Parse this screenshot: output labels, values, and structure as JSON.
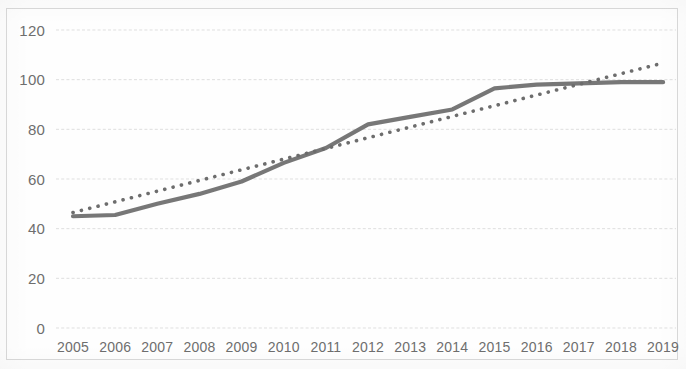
{
  "chart_data": {
    "type": "line",
    "title": "",
    "xlabel": "",
    "ylabel": "",
    "grid": true,
    "legend": "none",
    "ylim": [
      0,
      120
    ],
    "ytick_labels": [
      "120",
      "100",
      "80",
      "60",
      "40",
      "20",
      "0"
    ],
    "yticks": [
      120,
      100,
      80,
      60,
      40,
      20,
      0
    ],
    "categories": [
      "2005",
      "2006",
      "2007",
      "2008",
      "2009",
      "2010",
      "2011",
      "2012",
      "2013",
      "2014",
      "2015",
      "2016",
      "2017",
      "2018",
      "2019"
    ],
    "x": [
      2005,
      2006,
      2007,
      2008,
      2009,
      2010,
      2011,
      2012,
      2013,
      2014,
      2015,
      2016,
      2017,
      2018,
      2019
    ],
    "series": [
      {
        "name": "data-series",
        "style": "solid",
        "color": "#6b6b6b",
        "values": [
          45,
          45.5,
          50,
          54,
          59,
          66.5,
          72.5,
          82,
          85,
          88,
          96.5,
          98,
          98.5,
          99,
          99
        ]
      },
      {
        "name": "trendline",
        "style": "dotted",
        "color": "#5d5d5d",
        "values": [
          46.5,
          50.8,
          55.1,
          59.4,
          63.7,
          68,
          72.3,
          76.6,
          80.9,
          85.2,
          89.5,
          93.8,
          98.1,
          102.4,
          106.7
        ]
      }
    ],
    "colors": {
      "series_line": "#6b6b6b",
      "trend_line": "#5d5d5d",
      "gridline": "#d5d5d5",
      "tick_text": "#6e6e6e",
      "background": "#fefefe"
    }
  }
}
